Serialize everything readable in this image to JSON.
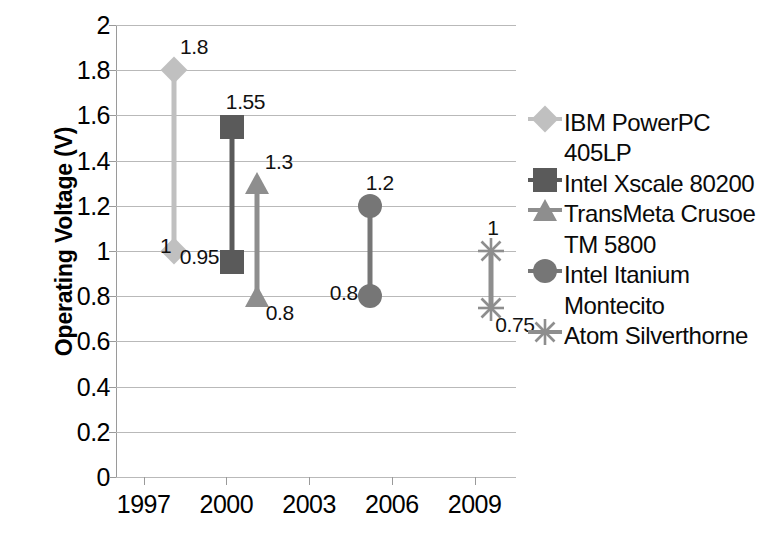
{
  "chart_data": {
    "type": "line",
    "title": "",
    "xlabel": "",
    "ylabel": "Operating Voltage (V)",
    "xlim": [
      1996,
      2010.5
    ],
    "ylim": [
      0,
      2
    ],
    "ytick_values": [
      0,
      0.2,
      0.4,
      0.6,
      0.8,
      1,
      1.2,
      1.4,
      1.6,
      1.8,
      2
    ],
    "ytick_labels": [
      "0",
      "0.2",
      "0.4",
      "0.6",
      "0.8",
      "1",
      "1.2",
      "1.4",
      "1.6",
      "1.8",
      "2"
    ],
    "xtick_values": [
      1997,
      2000,
      2003,
      2006,
      2009
    ],
    "xtick_labels": [
      "1997",
      "2000",
      "2003",
      "2006",
      "2009"
    ],
    "grid": "horizontal",
    "legend_position": "right",
    "series": [
      {
        "name": "IBM PowerPC 405LP",
        "marker": "diamond",
        "color": "#c0c0c0",
        "x": 1998.1,
        "values": [
          1.8,
          1
        ],
        "labels": [
          "1.8",
          "1"
        ]
      },
      {
        "name": "Intel Xscale 80200",
        "marker": "square",
        "color": "#5a5a5a",
        "x": 2000.2,
        "values": [
          1.55,
          0.95
        ],
        "labels": [
          "1.55",
          "0.95"
        ]
      },
      {
        "name": "TransMeta Crusoe TM 5800",
        "marker": "triangle",
        "color": "#8e8e8e",
        "x": 2001.1,
        "values": [
          1.3,
          0.8
        ],
        "labels": [
          "1.3",
          "0.8"
        ]
      },
      {
        "name": "Intel Itanium Montecito",
        "marker": "circle",
        "color": "#767676",
        "x": 2005.2,
        "values": [
          1.2,
          0.8
        ],
        "labels": [
          "1.2",
          "0.8"
        ]
      },
      {
        "name": "Atom Silverthorne",
        "marker": "asterisk",
        "color": "#8e8e8e",
        "x": 2009.6,
        "values": [
          1,
          0.75
        ],
        "labels": [
          "1",
          "0.75"
        ]
      }
    ]
  },
  "legend": {
    "entries": [
      {
        "label": "IBM PowerPC 405LP",
        "marker": "diamond-icon",
        "color": "#c0c0c0"
      },
      {
        "label": "Intel Xscale 80200",
        "marker": "square-icon",
        "color": "#5a5a5a"
      },
      {
        "label": "TransMeta Crusoe TM 5800",
        "marker": "triangle-icon",
        "color": "#8e8e8e"
      },
      {
        "label": "Intel Itanium Montecito",
        "marker": "circle-icon",
        "color": "#767676"
      },
      {
        "label": "Atom Silverthorne",
        "marker": "asterisk-icon",
        "color": "#8e8e8e"
      }
    ]
  }
}
